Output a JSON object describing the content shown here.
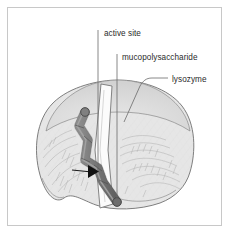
{
  "figure": {
    "frame": {
      "border_color": "#c8c8c8",
      "background_color": "#ffffff"
    },
    "labels": [
      {
        "id": "active-site",
        "text": "active site",
        "x": 104,
        "y": 36
      },
      {
        "id": "mucopolysaccharide",
        "text": "mucopolysaccharide",
        "x": 122,
        "y": 60
      },
      {
        "id": "lysozyme",
        "text": "lysozyme",
        "x": 172,
        "y": 82
      }
    ],
    "colors": {
      "enzyme_fill": "#e3e3e3",
      "enzyme_cap_fill": "#d7d7d7",
      "enzyme_outline": "#6f6f6f",
      "cleft_fill": "#fbfbfb",
      "chain_fill": "#777777",
      "chain_shade": "#8f8f8f",
      "chain_outline": "#3a3a3a",
      "arrow_fill": "#111111",
      "leader_line": "#6a6a6a",
      "text": "#2b2b2b"
    },
    "parts": {
      "enzyme_name": "lysozyme",
      "substrate_name": "mucopolysaccharide",
      "site_name": "active site",
      "cleavage_marker": "arrow"
    }
  }
}
